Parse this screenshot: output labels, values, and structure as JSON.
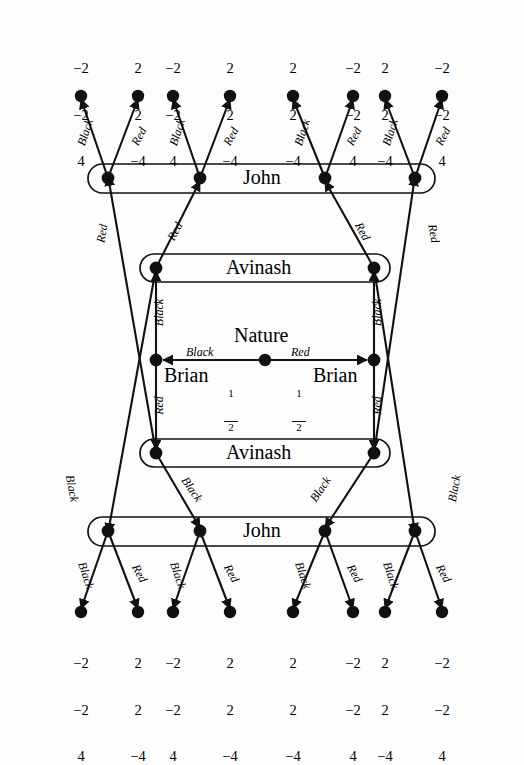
{
  "figure": {
    "type": "extensive-form-game-tree",
    "players": [
      "Nature",
      "Brian",
      "Avinash",
      "John"
    ],
    "moves": [
      "Black",
      "Red"
    ],
    "chance_probability": "1/2",
    "background_color": "#fdfdfd",
    "ink_color": "#111111"
  },
  "nature": {
    "label": "Nature",
    "left_move": "Black",
    "right_move": "Red",
    "left_prob_num": "1",
    "left_prob_den": "2",
    "right_prob_num": "1",
    "right_prob_den": "2"
  },
  "brian": {
    "left_label": "Brian",
    "right_label": "Brian",
    "up_move": "Black",
    "down_move": "Red"
  },
  "avinash": {
    "top_label": "Avinash",
    "bottom_label": "Avinash",
    "top_move": "Red",
    "bottom_move": "Black"
  },
  "john": {
    "top_label": "John",
    "bottom_label": "John",
    "left_move": "Black",
    "right_move": "Red"
  },
  "top_payoffs": [
    {
      "a": "−2",
      "b": "−2",
      "c": "4"
    },
    {
      "a": "2",
      "b": "2",
      "c": "−4"
    },
    {
      "a": "−2",
      "b": "−2",
      "c": "4"
    },
    {
      "a": "2",
      "b": "2",
      "c": "−4"
    },
    {
      "a": "2",
      "b": "2",
      "c": "−4"
    },
    {
      "a": "−2",
      "b": "−2",
      "c": "4"
    },
    {
      "a": "2",
      "b": "2",
      "c": "−4"
    },
    {
      "a": "−2",
      "b": "−2",
      "c": "4"
    }
  ],
  "bottom_payoffs": [
    {
      "a": "−2",
      "b": "−2",
      "c": "4"
    },
    {
      "a": "2",
      "b": "2",
      "c": "−4"
    },
    {
      "a": "−2",
      "b": "−2",
      "c": "4"
    },
    {
      "a": "2",
      "b": "2",
      "c": "−4"
    },
    {
      "a": "2",
      "b": "2",
      "c": "−4"
    },
    {
      "a": "−2",
      "b": "−2",
      "c": "4"
    },
    {
      "a": "2",
      "b": "2",
      "c": "−4"
    },
    {
      "a": "−2",
      "b": "−2",
      "c": "4"
    }
  ],
  "top_branch_labels": [
    "Black",
    "Red",
    "Black",
    "Red",
    "Black",
    "Red",
    "Black",
    "Red"
  ],
  "bottom_branch_labels": [
    "Black",
    "Red",
    "Black",
    "Red",
    "Black",
    "Red",
    "Black",
    "Red"
  ],
  "upper_mid_labels": [
    "Red",
    "Red",
    "Red",
    "Red"
  ],
  "lower_mid_labels": [
    "Black",
    "Black",
    "Black",
    "Black"
  ]
}
